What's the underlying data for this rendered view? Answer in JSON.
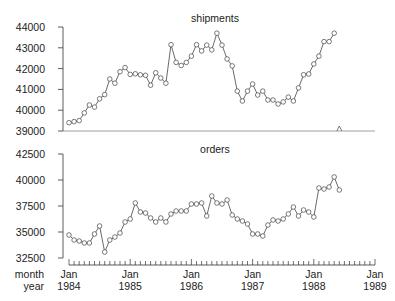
{
  "chart_data": {
    "type": "line",
    "x_axis": {
      "row_labels": [
        "month",
        "year"
      ],
      "ticks": [
        {
          "month": "Jan",
          "year": "1984",
          "index": 0
        },
        {
          "month": "Jan",
          "year": "1985",
          "index": 12
        },
        {
          "month": "Jan",
          "year": "1986",
          "index": 24
        },
        {
          "month": "Jan",
          "year": "1987",
          "index": 36
        },
        {
          "month": "Jan",
          "year": "1988",
          "index": 48
        },
        {
          "month": "Jan",
          "year": "1989",
          "index": 60
        }
      ],
      "range_months": [
        0,
        60
      ],
      "start": "Jan 1984"
    },
    "panels": [
      {
        "title": "shipments",
        "ylim": [
          39000,
          44000
        ],
        "yticks": [
          39000,
          40000,
          41000,
          42000,
          43000,
          44000
        ],
        "missing_marker_index": 53,
        "values": [
          39400,
          39450,
          39500,
          39870,
          40250,
          40150,
          40550,
          40750,
          41500,
          41300,
          41850,
          42050,
          41720,
          41750,
          41700,
          41680,
          41200,
          41800,
          41550,
          41300,
          43150,
          42300,
          42150,
          42300,
          42600,
          43150,
          42850,
          43130,
          42900,
          43700,
          43130,
          42460,
          42130,
          40920,
          40440,
          40920,
          41260,
          40730,
          40920,
          40490,
          40490,
          40300,
          40400,
          40630,
          40440,
          41070,
          41700,
          41740,
          42220,
          42600,
          43300,
          43300,
          43700
        ]
      },
      {
        "title": "orders",
        "ylim": [
          32500,
          42500
        ],
        "yticks": [
          32500,
          35000,
          37500,
          40000,
          42500
        ],
        "values": [
          34710,
          34230,
          34130,
          33940,
          33940,
          34810,
          35580,
          33080,
          34230,
          34520,
          34900,
          35960,
          36250,
          37790,
          36920,
          36830,
          36350,
          35960,
          36350,
          35960,
          36730,
          37020,
          37020,
          37020,
          37690,
          37690,
          37790,
          36540,
          38460,
          37790,
          37690,
          38080,
          36630,
          36250,
          36060,
          35770,
          34810,
          34810,
          34620,
          35670,
          36150,
          36060,
          36250,
          36730,
          37400,
          36540,
          37120,
          36920,
          36440,
          39230,
          39130,
          39330,
          40290,
          39040
        ]
      }
    ],
    "xlabel": "month / year",
    "ylabel": "",
    "grid": false,
    "legend": null
  }
}
